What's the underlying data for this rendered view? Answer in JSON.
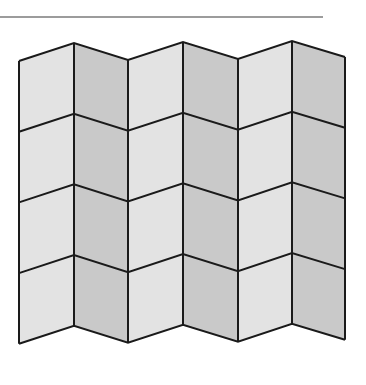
{
  "figure": {
    "columns": 6,
    "rows": 4,
    "column_x": [
      19,
      74,
      128,
      183,
      238,
      292,
      345
    ],
    "top_y": [
      61,
      43,
      60,
      42,
      59,
      41,
      57
    ],
    "row_height": 70.7,
    "colors": {
      "light_face": "#e3e3e3",
      "dark_face": "#c9c9c9",
      "stroke": "#1a1a1a",
      "rule": "#9c9c9c",
      "background": "#ffffff"
    }
  },
  "top_rule": {
    "x": 0,
    "y": 16,
    "width": 323
  }
}
